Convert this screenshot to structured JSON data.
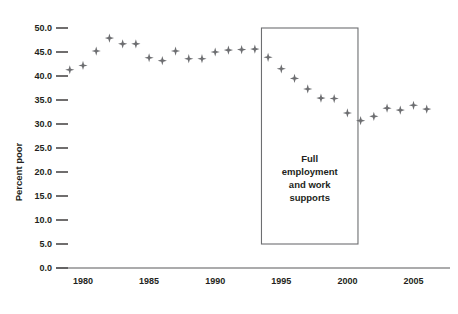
{
  "chart_data": {
    "type": "scatter",
    "title": "",
    "xlabel": "",
    "ylabel": "Percent poor",
    "xlim": [
      1978.2,
      2007.2
    ],
    "ylim": [
      0.0,
      50.0
    ],
    "grid": false,
    "legend": "none",
    "marker_color": "#6d6e71",
    "marker_shape": "four-pointed-star",
    "yticks": [
      0.0,
      5.0,
      10.0,
      15.0,
      20.0,
      25.0,
      30.0,
      35.0,
      40.0,
      45.0,
      50.0
    ],
    "ytick_labels": [
      "0.0",
      "5.0",
      "10.0",
      "15.0",
      "20.0",
      "25.0",
      "30.0",
      "35.0",
      "40.0",
      "45.0",
      "50.0"
    ],
    "xticks": [
      1980,
      1985,
      1990,
      1995,
      2000,
      2005
    ],
    "xtick_labels": [
      "1980",
      "1985",
      "1990",
      "1995",
      "2000",
      "2005"
    ],
    "x": [
      1979,
      1980,
      1981,
      1982,
      1983,
      1984,
      1985,
      1986,
      1987,
      1988,
      1989,
      1990,
      1991,
      1992,
      1993,
      1994,
      1995,
      1996,
      1997,
      1998,
      1999,
      2000,
      2001,
      2002,
      2003,
      2004,
      2005,
      2006
    ],
    "values": [
      41.3,
      42.2,
      45.2,
      47.9,
      46.7,
      46.7,
      43.8,
      43.2,
      45.2,
      43.6,
      43.6,
      45.0,
      45.4,
      45.5,
      45.6,
      43.9,
      41.5,
      39.5,
      37.3,
      35.4,
      35.3,
      32.3,
      30.7,
      31.6,
      33.3,
      32.9,
      33.9,
      33.1
    ],
    "annotations": [
      {
        "name": "full-employment-box",
        "lines": [
          "Full",
          "employment",
          "and work",
          "supports"
        ],
        "x_start": 1993.5,
        "x_end": 2000.8,
        "y_top": 50.0,
        "y_bottom": 5.0
      }
    ]
  }
}
